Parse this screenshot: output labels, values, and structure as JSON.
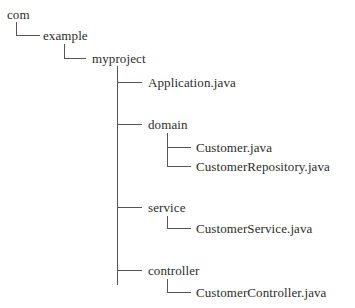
{
  "diagram": {
    "type": "directory-tree",
    "root": {
      "label": "com",
      "children": [
        {
          "label": "example",
          "children": [
            {
              "label": "myproject",
              "children": [
                {
                  "label": "Application.java"
                },
                {
                  "label": "domain",
                  "children": [
                    {
                      "label": "Customer.java"
                    },
                    {
                      "label": "CustomerRepository.java"
                    }
                  ]
                },
                {
                  "label": "service",
                  "children": [
                    {
                      "label": "CustomerService.java"
                    }
                  ]
                },
                {
                  "label": "controller",
                  "children": [
                    {
                      "label": "CustomerController.java"
                    }
                  ]
                }
              ]
            }
          ]
        }
      ]
    }
  },
  "nodes": {
    "com": "com",
    "example": "example",
    "myproject": "myproject",
    "application": "Application.java",
    "domain": "domain",
    "customer": "Customer.java",
    "customer_repository": "CustomerRepository.java",
    "service": "service",
    "customer_service": "CustomerService.java",
    "controller": "controller",
    "customer_controller": "CustomerController.java"
  },
  "colors": {
    "background": "#ffffff",
    "text": "#2b2b2b",
    "lines": "#555555"
  }
}
